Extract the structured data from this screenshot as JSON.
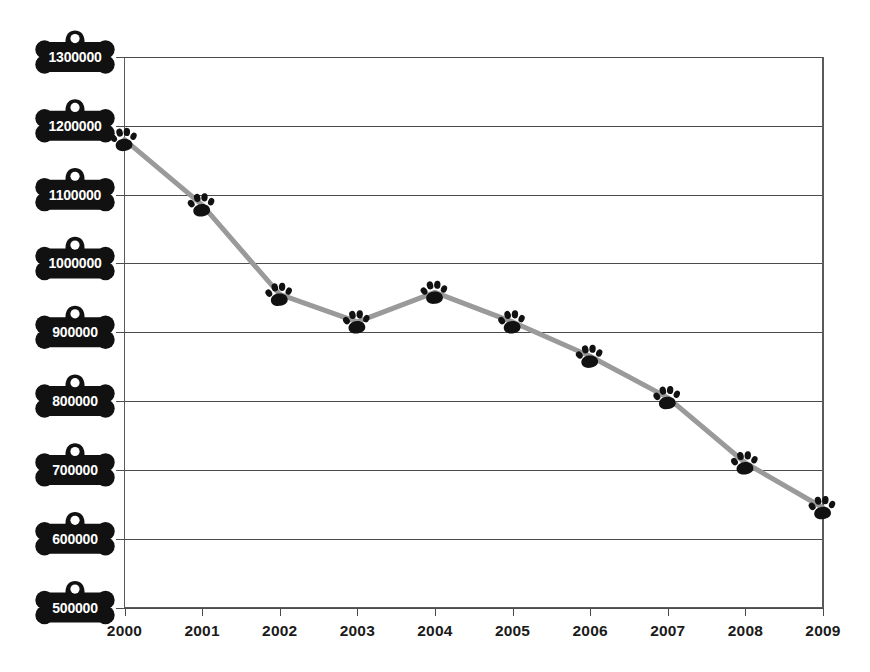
{
  "chart_data": {
    "type": "line",
    "title": "",
    "subtitle": "",
    "xlabel": "",
    "ylabel": "",
    "categories": [
      "2000",
      "2001",
      "2002",
      "2003",
      "2004",
      "2005",
      "2006",
      "2007",
      "2008",
      "2009"
    ],
    "x": [
      2000,
      2001,
      2002,
      2003,
      2004,
      2005,
      2006,
      2007,
      2008,
      2009
    ],
    "values": [
      1180000,
      1085000,
      955000,
      915000,
      958000,
      915000,
      865000,
      805000,
      710000,
      645000
    ],
    "series": [
      {
        "name": "",
        "values": [
          1180000,
          1085000,
          955000,
          915000,
          958000,
          915000,
          865000,
          805000,
          710000,
          645000
        ]
      }
    ],
    "ylim": [
      500000,
      1300000
    ],
    "ytick_labels": [
      "1300000",
      "1200000",
      "1100000",
      "1000000",
      "900000",
      "800000",
      "700000",
      "600000",
      "500000"
    ],
    "ytick_values": [
      1300000,
      1200000,
      1100000,
      1000000,
      900000,
      800000,
      700000,
      600000,
      500000
    ],
    "xtick_labels": [
      "2000",
      "2001",
      "2002",
      "2003",
      "2004",
      "2005",
      "2006",
      "2007",
      "2008",
      "2009"
    ],
    "grid": true,
    "grid_axis": "y",
    "legend": false,
    "legend_position": "none",
    "marker": "paw-print-icon",
    "ytick_label_style": "dog-bone-tag-icon",
    "annotations": []
  },
  "colors": {
    "background": "#ffffff",
    "line": "#9a9a9a",
    "marker": "#111111",
    "gridline": "#4c4c4c",
    "axis": "#5a5a5a",
    "ytick_tag_fill": "#111111",
    "ytick_tag_text": "#ffffff",
    "xtick_text": "#1b1b1b"
  },
  "icons": {
    "ytick": "dog-bone-tag-icon",
    "marker": "paw-print-icon"
  }
}
